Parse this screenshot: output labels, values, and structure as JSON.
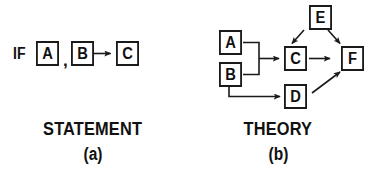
{
  "figure": {
    "background_color": "#ffffff",
    "ink_color": "#1a1a1a",
    "panels": [
      {
        "id": "statement",
        "caption_title": "STATEMENT",
        "caption_sub": "(a)",
        "prefix_label": "IF",
        "separator_label": ",",
        "nodes": [
          {
            "id": "A",
            "label": "A"
          },
          {
            "id": "B",
            "label": "B"
          },
          {
            "id": "C",
            "label": "C"
          }
        ],
        "edges": [
          {
            "from": "B",
            "to": "C",
            "style": "straight-arrow"
          }
        ]
      },
      {
        "id": "theory",
        "caption_title": "THEORY",
        "caption_sub": "(b)",
        "nodes": [
          {
            "id": "A",
            "label": "A"
          },
          {
            "id": "B",
            "label": "B"
          },
          {
            "id": "C",
            "label": "C"
          },
          {
            "id": "D",
            "label": "D"
          },
          {
            "id": "E",
            "label": "E"
          },
          {
            "id": "F",
            "label": "F"
          }
        ],
        "edges": [
          {
            "from": "A",
            "to": "C",
            "style": "bracket-join-arrow"
          },
          {
            "from": "B",
            "to": "C",
            "style": "bracket-join-arrow"
          },
          {
            "from": "B",
            "to": "D",
            "style": "elbow-arrow"
          },
          {
            "from": "C",
            "to": "F",
            "style": "straight-arrow"
          },
          {
            "from": "D",
            "to": "F",
            "style": "diagonal-arrow"
          },
          {
            "from": "E",
            "to": "C",
            "style": "diagonal-arrow"
          },
          {
            "from": "E",
            "to": "F",
            "style": "diagonal-arrow"
          }
        ]
      }
    ]
  }
}
